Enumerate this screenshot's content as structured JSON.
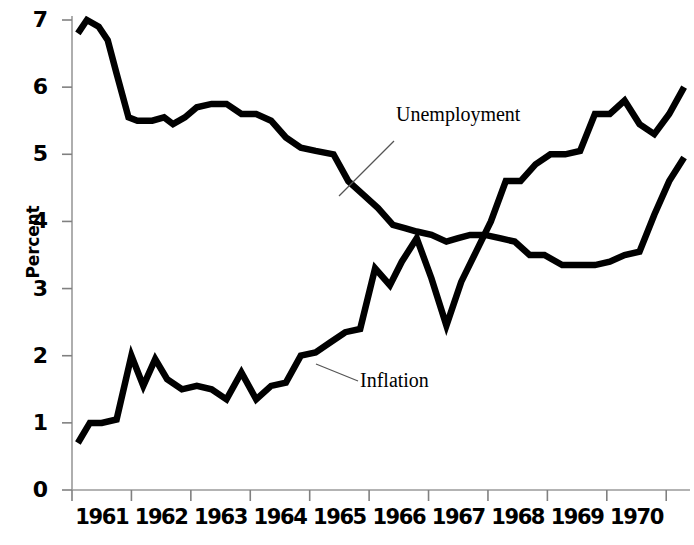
{
  "chart_data": {
    "type": "line",
    "title": "",
    "subtitle": "",
    "xlabel": "",
    "ylabel": "Percent",
    "ylim": [
      0,
      7
    ],
    "xlim": [
      1960.5,
      1970.9
    ],
    "grid": false,
    "legend_position": "inline-annotations",
    "y_ticks": [
      "0",
      "1",
      "2",
      "3",
      "4",
      "5",
      "6",
      "7"
    ],
    "y_tick_values": [
      0,
      1,
      2,
      3,
      4,
      5,
      6,
      7
    ],
    "x_ticks": [
      "1961",
      "1962",
      "1963",
      "1964",
      "1965",
      "1966",
      "1967",
      "1968",
      "1969",
      "1970"
    ],
    "x_tick_values": [
      1961,
      1962,
      1963,
      1964,
      1965,
      1966,
      1967,
      1968,
      1969,
      1970
    ],
    "line_color": "#000000",
    "axis_color": "#808080",
    "background": "#ffffff",
    "series": [
      {
        "name": "Unemployment",
        "annotation": "Unemployment",
        "x": [
          1960.6,
          1960.75,
          1960.95,
          1961.1,
          1961.25,
          1961.45,
          1961.6,
          1961.85,
          1962.05,
          1962.2,
          1962.4,
          1962.6,
          1962.85,
          1963.1,
          1963.35,
          1963.6,
          1963.85,
          1964.1,
          1964.35,
          1964.6,
          1964.9,
          1965.15,
          1965.4,
          1965.65,
          1965.9,
          1966.1,
          1966.3,
          1966.55,
          1966.8,
          1967.0,
          1967.2,
          1967.45,
          1967.7,
          1967.95,
          1968.2,
          1968.45,
          1968.75,
          1969.0,
          1969.3,
          1969.55,
          1969.8,
          1970.05,
          1970.3,
          1970.55,
          1970.8
        ],
        "y": [
          6.8,
          7.0,
          6.9,
          6.7,
          6.2,
          5.55,
          5.5,
          5.5,
          5.55,
          5.45,
          5.55,
          5.7,
          5.75,
          5.75,
          5.6,
          5.6,
          5.5,
          5.25,
          5.1,
          5.05,
          5.0,
          4.6,
          4.4,
          4.2,
          3.95,
          3.9,
          3.85,
          3.8,
          3.7,
          3.75,
          3.8,
          3.8,
          3.75,
          3.7,
          3.5,
          3.5,
          3.35,
          3.35,
          3.35,
          3.4,
          3.5,
          3.55,
          4.1,
          4.6,
          4.95
        ]
      },
      {
        "name": "Inflation",
        "annotation": "Inflation",
        "x": [
          1960.6,
          1960.8,
          1961.0,
          1961.25,
          1961.5,
          1961.7,
          1961.9,
          1962.1,
          1962.35,
          1962.6,
          1962.85,
          1963.1,
          1963.35,
          1963.6,
          1963.85,
          1964.1,
          1964.35,
          1964.6,
          1964.85,
          1965.1,
          1965.35,
          1965.6,
          1965.85,
          1966.05,
          1966.3,
          1966.55,
          1966.8,
          1967.05,
          1967.3,
          1967.55,
          1967.8,
          1968.05,
          1968.3,
          1968.55,
          1968.8,
          1969.05,
          1969.3,
          1969.55,
          1969.8,
          1970.05,
          1970.3,
          1970.55,
          1970.8
        ],
        "y": [
          0.7,
          1.0,
          1.0,
          1.05,
          2.0,
          1.55,
          1.95,
          1.65,
          1.5,
          1.55,
          1.5,
          1.35,
          1.75,
          1.35,
          1.55,
          1.6,
          2.0,
          2.05,
          2.2,
          2.35,
          2.4,
          3.3,
          3.05,
          3.4,
          3.75,
          3.15,
          2.45,
          3.1,
          3.55,
          4.0,
          4.6,
          4.6,
          4.85,
          5.0,
          5.0,
          5.05,
          5.6,
          5.6,
          5.8,
          5.45,
          5.3,
          5.6,
          6.0
        ]
      }
    ]
  },
  "annotations": {
    "unemployment": {
      "text": "Unemployment",
      "leader_from": [
        339,
        196
      ],
      "leader_to": [
        394,
        141
      ]
    },
    "inflation": {
      "text": "Inflation",
      "leader_from": [
        316,
        364
      ],
      "leader_to": [
        358,
        381
      ]
    }
  }
}
